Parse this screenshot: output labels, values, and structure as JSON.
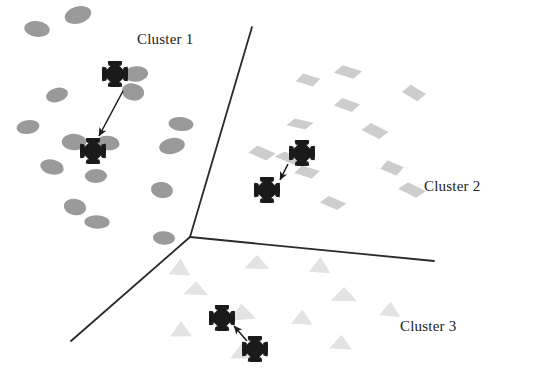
{
  "figure": {
    "background_color": "#ffffff",
    "width": 545,
    "height": 379
  },
  "chart_data": {
    "type": "scatter",
    "title": "",
    "xlabel": "",
    "ylabel": "",
    "grid": false,
    "axes_visible": false,
    "legend": "none",
    "xlim": [
      0,
      545
    ],
    "ylim": [
      0,
      379
    ],
    "note": "Coordinates are in pixel space of the original figure; y increases downward.",
    "series": [
      {
        "name": "Cluster 1",
        "marker": "ellipse",
        "color": "#9a9a9a",
        "marker_width": 25,
        "marker_height": 15,
        "points": [
          [
            37,
            29
          ],
          [
            78,
            15
          ],
          [
            57,
            95
          ],
          [
            136,
            74
          ],
          [
            133,
            92
          ],
          [
            28,
            127
          ],
          [
            74,
            142
          ],
          [
            108,
            143
          ],
          [
            181,
            124
          ],
          [
            52,
            167
          ],
          [
            96,
            176
          ],
          [
            172,
            146
          ],
          [
            162,
            190
          ],
          [
            97,
            222
          ],
          [
            164,
            238
          ],
          [
            75,
            207
          ]
        ]
      },
      {
        "name": "Cluster 2",
        "marker": "diamond",
        "color": "#cdcdcd",
        "marker_width": 26,
        "marker_height": 14,
        "points": [
          [
            308,
            80
          ],
          [
            348,
            72
          ],
          [
            414,
            93
          ],
          [
            347,
            105
          ],
          [
            300,
            124
          ],
          [
            375,
            131
          ],
          [
            289,
            158
          ],
          [
            307,
            172
          ],
          [
            392,
            168
          ],
          [
            412,
            190
          ],
          [
            333,
            203
          ],
          [
            262,
            153
          ]
        ]
      },
      {
        "name": "Cluster 3",
        "marker": "triangle",
        "color": "#e3e3e3",
        "marker_width": 24,
        "marker_height": 15,
        "points": [
          [
            180,
            268
          ],
          [
            257,
            263
          ],
          [
            320,
            266
          ],
          [
            196,
            289
          ],
          [
            344,
            295
          ],
          [
            242,
            313
          ],
          [
            181,
            330
          ],
          [
            242,
            352
          ],
          [
            341,
            343
          ],
          [
            302,
            318
          ],
          [
            390,
            310
          ]
        ]
      },
      {
        "name": "Centroids",
        "marker": "cross",
        "color": "#1a1a1a",
        "marker_size": 26,
        "points": [
          [
            115,
            74
          ],
          [
            93,
            151
          ],
          [
            302,
            153
          ],
          [
            267,
            190
          ],
          [
            222,
            318
          ],
          [
            255,
            349
          ]
        ]
      }
    ],
    "arrows": [
      {
        "label": "cluster-1-centroid-shift",
        "from": [
          123,
          91
        ],
        "to": [
          99,
          136
        ]
      },
      {
        "label": "cluster-2-centroid-shift",
        "from": [
          288,
          164
        ],
        "to": [
          280,
          180
        ]
      },
      {
        "label": "cluster-3-centroid-shift",
        "from": [
          247,
          341
        ],
        "to": [
          234,
          326
        ]
      }
    ],
    "boundaries": [
      {
        "label": "boundary-upper",
        "from": [
          190,
          237
        ],
        "to": [
          252,
          27
        ]
      },
      {
        "label": "boundary-right",
        "from": [
          190,
          237
        ],
        "to": [
          434,
          261
        ]
      },
      {
        "label": "boundary-lower-left",
        "from": [
          190,
          237
        ],
        "to": [
          71,
          341
        ]
      }
    ],
    "boundary_color": "#2a2a2a",
    "boundary_width": 1.8
  },
  "labels": {
    "cluster1": {
      "text": "Cluster 1",
      "x": 137,
      "y": 31
    },
    "cluster2": {
      "text": "Cluster 2",
      "x": 424,
      "y": 178
    },
    "cluster3": {
      "text": "Cluster 3",
      "x": 400,
      "y": 318
    }
  }
}
